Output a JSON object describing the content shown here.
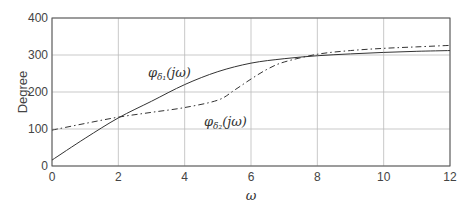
{
  "chart_data": {
    "type": "line",
    "title": "",
    "xlabel": "ω",
    "ylabel": "Degree",
    "xlim": [
      0,
      12
    ],
    "ylim": [
      0,
      400
    ],
    "grid": true,
    "legend": "none (inline annotations)",
    "x_ticks": [
      "0",
      "2",
      "4",
      "6",
      "8",
      "10",
      "12"
    ],
    "y_ticks": [
      "0",
      "100",
      "200",
      "300",
      "400"
    ],
    "series": [
      {
        "name": "φδ1(jω)",
        "style": "solid",
        "x": [
          0,
          1,
          2,
          3,
          4,
          5,
          6,
          7,
          8,
          9,
          10,
          11,
          12
        ],
        "values": [
          16,
          75,
          130,
          175,
          220,
          255,
          278,
          290,
          298,
          303,
          307,
          310,
          312
        ]
      },
      {
        "name": "φδ2(jω)",
        "style": "dash-dot",
        "x": [
          0,
          1,
          2,
          3,
          4,
          5,
          5.5,
          6,
          6.5,
          7,
          8,
          9,
          10,
          11,
          12
        ],
        "values": [
          97,
          115,
          132,
          145,
          158,
          178,
          205,
          235,
          262,
          281,
          302,
          312,
          318,
          322,
          326
        ]
      }
    ],
    "annotations": [
      {
        "text": "φδ1(jω)",
        "x": 3.0,
        "y": 245
      },
      {
        "text": "φδ2(jω)",
        "x": 4.6,
        "y": 120
      }
    ]
  },
  "labels": {
    "ylabel": "Degree",
    "xlabel": "ω",
    "ann1_main": "φ",
    "ann1_sub": "δ₁",
    "ann1_arg": "(jω)",
    "ann2_main": "φ",
    "ann2_sub": "δ₂",
    "ann2_arg": "(jω)"
  }
}
